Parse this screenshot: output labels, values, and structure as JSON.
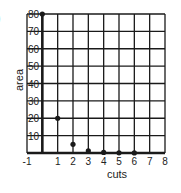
{
  "fragment_label": ")",
  "chart_data": {
    "type": "scatter",
    "title": "",
    "xlabel": "cuts",
    "ylabel": "area",
    "x": [
      0,
      1,
      2,
      3,
      4,
      5,
      6
    ],
    "values": [
      80,
      20,
      5,
      1.25,
      0.3125,
      0.078,
      0.0195
    ],
    "xlim": [
      -1,
      8
    ],
    "ylim": [
      0,
      80
    ],
    "xticks": [
      "-1",
      "1",
      "2",
      "3",
      "4",
      "5",
      "6",
      "7",
      "8"
    ],
    "xtick_values": [
      -1,
      1,
      2,
      3,
      4,
      5,
      6,
      7,
      8
    ],
    "yticks": [
      "10",
      "20",
      "30",
      "40",
      "50",
      "60",
      "70",
      "80"
    ],
    "ytick_values": [
      10,
      20,
      30,
      40,
      50,
      60,
      70,
      80
    ],
    "grid": true,
    "legend": null
  },
  "colors": {
    "grid": "#1a1a1a",
    "points": "#1a1a1a",
    "text": "#222222",
    "background": "#ffffff"
  }
}
